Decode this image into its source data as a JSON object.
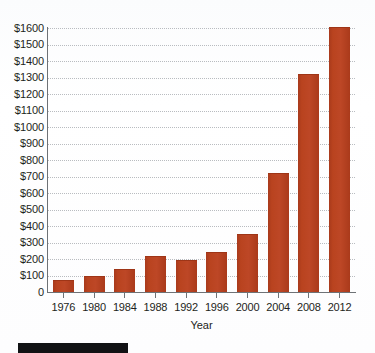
{
  "chart_data": {
    "type": "bar",
    "title": "",
    "xlabel": "Year",
    "ylabel": "",
    "categories": [
      "1976",
      "1980",
      "1984",
      "1988",
      "1992",
      "1996",
      "2000",
      "2004",
      "2008",
      "2012"
    ],
    "values": [
      65,
      90,
      132,
      215,
      190,
      235,
      345,
      715,
      1315,
      1600
    ],
    "ylim": [
      0,
      1600
    ],
    "ytick_step": 100,
    "ytick_labels": [
      "$1600",
      "$1500",
      "$1400",
      "$1300",
      "$1200",
      "$1100",
      "$1000",
      "$900",
      "$800",
      "$700",
      "$600",
      "$500",
      "$400",
      "$300",
      "$200",
      "$100",
      "0"
    ],
    "ytick_values": [
      1600,
      1500,
      1400,
      1300,
      1200,
      1100,
      1000,
      900,
      800,
      700,
      600,
      500,
      400,
      300,
      200,
      100,
      0
    ],
    "grid": true,
    "grid_style": "dotted",
    "legend": "none",
    "series": [
      {
        "name": "Value",
        "values": [
          65,
          90,
          132,
          215,
          190,
          235,
          345,
          715,
          1315,
          1600
        ]
      }
    ]
  },
  "colors": {
    "bar": "#b9431f",
    "bar_edge": "#9e3517",
    "axis": "#6e7276",
    "grid": "#b9bcc0",
    "text": "#1d1f21",
    "background": "#ffffff",
    "caption_bar": "#111214"
  },
  "axis": {
    "x_title": "Year"
  }
}
